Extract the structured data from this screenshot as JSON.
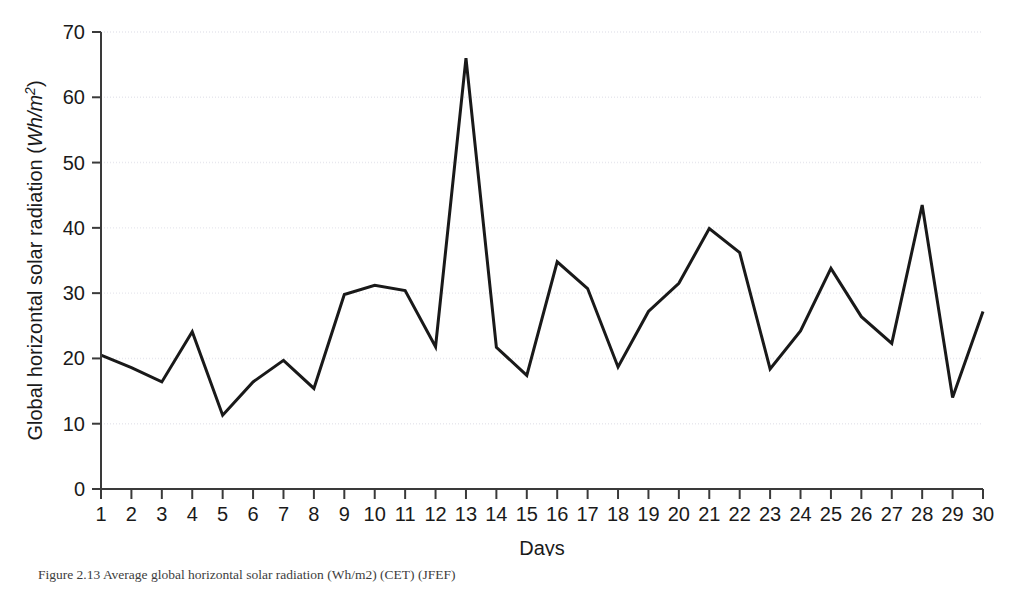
{
  "figure": {
    "caption": "Figure 2.13 Average global horizontal solar radiation (Wh/m2) (CET) (JFEF)",
    "background_color": "#ffffff",
    "line_color": "#191919",
    "axis_color": "#3a3a3a",
    "grid_color": "#e8e8ee"
  },
  "chart_data": {
    "type": "line",
    "title": "",
    "subtitle": "",
    "xlabel": "Days",
    "ylabel": "Global horizontal solar radiation (Wh/m2)",
    "ylabel_parts": {
      "prefix": "Global horizontal solar radiation (",
      "unit_italic": "Wh/m",
      "unit_exponent": "2",
      "suffix": ")"
    },
    "x": [
      1,
      2,
      3,
      4,
      5,
      6,
      7,
      8,
      9,
      10,
      11,
      12,
      13,
      14,
      15,
      16,
      17,
      18,
      19,
      20,
      21,
      22,
      23,
      24,
      25,
      26,
      27,
      28,
      29,
      30
    ],
    "xtick_labels": [
      "1",
      "2",
      "3",
      "4",
      "5",
      "6",
      "7",
      "8",
      "9",
      "10",
      "11",
      "12",
      "13",
      "14",
      "15",
      "16",
      "17",
      "18",
      "19",
      "20",
      "21",
      "22",
      "23",
      "24",
      "25",
      "26",
      "27",
      "28",
      "29",
      "30"
    ],
    "values": [
      20.5,
      18.6,
      16.4,
      24.1,
      11.3,
      16.4,
      19.7,
      15.4,
      29.8,
      31.2,
      30.4,
      21.8,
      66.0,
      21.7,
      17.4,
      34.8,
      30.7,
      18.7,
      27.2,
      31.5,
      39.9,
      36.2,
      18.4,
      24.2,
      33.8,
      26.4,
      22.3,
      43.5,
      14.0,
      27.2
    ],
    "ytick_labels": [
      "0",
      "10",
      "20",
      "30",
      "40",
      "50",
      "60",
      "70"
    ],
    "yticks": [
      0,
      10,
      20,
      30,
      40,
      50,
      60,
      70
    ],
    "ylim": [
      0,
      70
    ],
    "xlim": [
      1,
      30
    ],
    "grid": true,
    "grid_axis": "y",
    "legend": false,
    "legend_position": "none",
    "series": [
      {
        "name": "Global horizontal solar radiation",
        "values": [
          20.5,
          18.6,
          16.4,
          24.1,
          11.3,
          16.4,
          19.7,
          15.4,
          29.8,
          31.2,
          30.4,
          21.8,
          66.0,
          21.7,
          17.4,
          34.8,
          30.7,
          18.7,
          27.2,
          31.5,
          39.9,
          36.2,
          18.4,
          24.2,
          33.8,
          26.4,
          22.3,
          43.5,
          14.0,
          27.2
        ]
      }
    ],
    "annotations": []
  }
}
